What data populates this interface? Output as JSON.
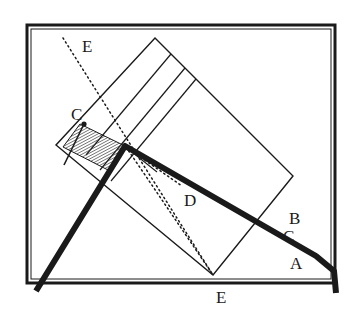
{
  "figure": {
    "background_color": "#ffffff",
    "ink_color": "#1a1a1a",
    "hatch_color": "#3a3a3a",
    "width": 354,
    "height": 318,
    "labels": [
      {
        "id": "label-e-top",
        "text": "E",
        "x": 82,
        "y": 38,
        "description": "upper dotted normal line label"
      },
      {
        "id": "label-c",
        "text": "C",
        "x": 71,
        "y": 106,
        "description": "incident point label"
      },
      {
        "id": "label-d",
        "text": "D",
        "x": 184,
        "y": 192,
        "description": "interior refracted ray label"
      },
      {
        "id": "label-b",
        "text": "B",
        "x": 289,
        "y": 210,
        "description": "upper emergent ray label"
      },
      {
        "id": "label-c2",
        "text": "C",
        "x": 283,
        "y": 228,
        "description": "lower small label on emergent ray"
      },
      {
        "id": "label-a",
        "text": "A",
        "x": 290,
        "y": 255,
        "description": "emergent ray label"
      },
      {
        "id": "label-e-bottom",
        "text": "E",
        "x": 216,
        "y": 289,
        "description": "lower vertex label on baseline"
      }
    ],
    "frame": {
      "name": "outer-frame",
      "x": 27,
      "y": 25,
      "width": 308,
      "height": 258,
      "stroke_width": 3,
      "inner_stroke_width": 1
    },
    "plate": {
      "name": "rotated-rectangle",
      "vertices": [
        {
          "x": 155,
          "y": 38
        },
        {
          "x": 293,
          "y": 176
        },
        {
          "x": 213,
          "y": 275
        },
        {
          "x": 56,
          "y": 145
        }
      ],
      "stroke_width": 1.4
    },
    "plate_bands": [
      {
        "from": {
          "x": 171,
          "y": 54
        },
        "to": {
          "x": 86,
          "y": 155
        }
      },
      {
        "from": {
          "x": 185,
          "y": 68
        },
        "to": {
          "x": 100,
          "y": 170
        }
      },
      {
        "from": {
          "x": 196,
          "y": 79
        },
        "to": {
          "x": 111,
          "y": 181
        }
      }
    ],
    "hatched_region": {
      "name": "hatched-parallelogram",
      "vertices": [
        {
          "x": 80,
          "y": 124
        },
        {
          "x": 125,
          "y": 146
        },
        {
          "x": 108,
          "y": 170
        },
        {
          "x": 63,
          "y": 147
        }
      ],
      "hatch_angle_deg": 62,
      "hatch_spacing": 2.4
    },
    "thick_ray": {
      "name": "thick-ray-path",
      "points": [
        {
          "x": 36,
          "y": 291
        },
        {
          "x": 125,
          "y": 146
        },
        {
          "x": 316,
          "y": 256
        },
        {
          "x": 334,
          "y": 271
        },
        {
          "x": 336,
          "y": 293
        }
      ],
      "stroke_width": 6
    },
    "thin_pointer": {
      "name": "pointer-to-incidence",
      "from": {
        "x": 84,
        "y": 124
      },
      "to": {
        "x": 64,
        "y": 165
      },
      "dot": {
        "x": 84,
        "y": 124,
        "r": 2.6
      }
    },
    "dotted_lines": [
      {
        "id": "dotted-normal-upper",
        "from": {
          "x": 63,
          "y": 38
        },
        "to": {
          "x": 213,
          "y": 275
        },
        "description": "long dotted normal from E top through plate to E bottom"
      },
      {
        "id": "dotted-ray-inner",
        "from": {
          "x": 126,
          "y": 147
        },
        "to": {
          "x": 213,
          "y": 275
        },
        "description": "dotted internal ray from incidence point to lower vertex"
      },
      {
        "id": "dotted-ray-short",
        "from": {
          "x": 126,
          "y": 147
        },
        "to": {
          "x": 182,
          "y": 186
        },
        "description": "short dotted ray toward D"
      }
    ],
    "solid_thin_lines": [
      {
        "id": "thin-ray-to-d",
        "from": {
          "x": 127,
          "y": 148
        },
        "to": {
          "x": 157,
          "y": 172
        }
      }
    ]
  }
}
